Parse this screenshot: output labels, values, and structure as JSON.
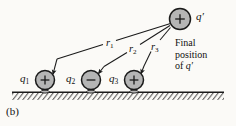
{
  "figure": {
    "panel_label": "(b)",
    "background_color": "#fbfaf7",
    "charge_fill_color": "#b5b5b5",
    "charge_stroke_color": "#1a1a1a",
    "ground_hatch_color": "#3a3a3a"
  },
  "charges": [
    {
      "name": "q1",
      "label": "q",
      "subscript": "1",
      "sign": "+",
      "cx": 45,
      "cy": 80,
      "r": 9.5,
      "label_x": 20,
      "label_y": 74
    },
    {
      "name": "q2",
      "label": "q",
      "subscript": "2",
      "sign": "−",
      "cx": 91,
      "cy": 80,
      "r": 9.5,
      "label_x": 66,
      "label_y": 74
    },
    {
      "name": "q3",
      "label": "q",
      "subscript": "3",
      "sign": "+",
      "cx": 134,
      "cy": 80,
      "r": 9.5,
      "label_x": 109,
      "label_y": 74
    }
  ],
  "moving_charge": {
    "name": "q-prime",
    "label": "q′",
    "sign": "+",
    "cx": 180,
    "cy": 19,
    "r": 10.5,
    "label_x": 196,
    "label_y": 13
  },
  "distance_labels": [
    {
      "name": "r1",
      "label": "r",
      "subscript": "1",
      "x": 107,
      "y": 43
    },
    {
      "name": "r2",
      "label": "r",
      "subscript": "2",
      "x": 131,
      "y": 48
    },
    {
      "name": "r3",
      "label": "r",
      "subscript": "3",
      "x": 152,
      "y": 47
    }
  ],
  "annotation": {
    "name": "final-position-note",
    "line1": "Final",
    "line2": "position",
    "line3_prefix": "of ",
    "line3_math": "q′",
    "x": 175,
    "y": 40
  },
  "ground": {
    "name": "ground-line",
    "y": 92,
    "x_start": 12,
    "x_end": 224,
    "hatch_depth": 8
  }
}
